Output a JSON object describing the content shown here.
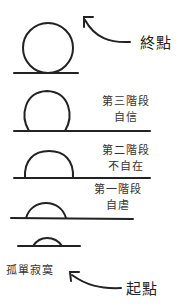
{
  "end_label": "終點",
  "start_label": "起點",
  "start_state": "孤單寂寞",
  "stages": [
    {
      "name": "第三階段",
      "state": "自信"
    },
    {
      "name": "第二階段",
      "state": "不自在"
    },
    {
      "name": "第一階段",
      "state": "自虐"
    }
  ],
  "colors": {
    "ink": "#222222",
    "background": "#ffffff"
  }
}
